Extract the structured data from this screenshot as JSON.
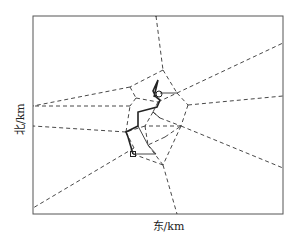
{
  "figure": {
    "xlabel": "东/km",
    "ylabel": "北/km",
    "frame": {
      "x": 33,
      "y": 16,
      "w": 250,
      "h": 198
    },
    "colors": {
      "line": "#333333",
      "frame": "#555555",
      "path": "#222222"
    },
    "dashed_edges": [
      [
        [
          156,
          16
        ],
        [
          163,
          70
        ]
      ],
      [
        [
          163,
          70
        ],
        [
          177,
          93
        ]
      ],
      [
        [
          163,
          70
        ],
        [
          130,
          87
        ]
      ],
      [
        [
          130,
          87
        ],
        [
          33,
          106
        ]
      ],
      [
        [
          130,
          87
        ],
        [
          136,
          98
        ]
      ],
      [
        [
          136,
          98
        ],
        [
          130,
          106
        ]
      ],
      [
        [
          130,
          106
        ],
        [
          33,
          106
        ]
      ],
      [
        [
          177,
          93
        ],
        [
          283,
          43
        ]
      ],
      [
        [
          177,
          93
        ],
        [
          188,
          105
        ]
      ],
      [
        [
          188,
          105
        ],
        [
          283,
          96
        ]
      ],
      [
        [
          188,
          105
        ],
        [
          181,
          126
        ]
      ],
      [
        [
          181,
          126
        ],
        [
          283,
          168
        ]
      ],
      [
        [
          181,
          126
        ],
        [
          163,
          165
        ]
      ],
      [
        [
          163,
          165
        ],
        [
          177,
          214
        ]
      ],
      [
        [
          163,
          165
        ],
        [
          133,
          154
        ]
      ],
      [
        [
          126,
          132
        ],
        [
          33,
          126
        ]
      ],
      [
        [
          126,
          132
        ],
        [
          130,
          106
        ]
      ],
      [
        [
          126,
          132
        ],
        [
          134,
          148
        ]
      ],
      [
        [
          134,
          148
        ],
        [
          33,
          208
        ]
      ],
      [
        [
          181,
          126
        ],
        [
          145,
          126
        ]
      ],
      [
        [
          145,
          126
        ],
        [
          126,
          132
        ]
      ],
      [
        [
          145,
          126
        ],
        [
          148,
          145
        ]
      ],
      [
        [
          148,
          145
        ],
        [
          163,
          165
        ]
      ],
      [
        [
          153,
          112
        ],
        [
          145,
          126
        ]
      ],
      [
        [
          153,
          112
        ],
        [
          160,
          118
        ]
      ],
      [
        [
          160,
          118
        ],
        [
          181,
          126
        ]
      ],
      [
        [
          165,
          137
        ],
        [
          181,
          126
        ]
      ],
      [
        [
          165,
          137
        ],
        [
          148,
          145
        ]
      ],
      [
        [
          136,
          98
        ],
        [
          158,
          102
        ]
      ],
      [
        [
          158,
          102
        ],
        [
          177,
          93
        ]
      ],
      [
        [
          158,
          102
        ],
        [
          153,
          112
        ]
      ],
      [
        [
          155,
          16
        ],
        [
          157,
          16
        ]
      ]
    ],
    "path": [
      [
        133,
        154
      ],
      [
        128,
        137
      ],
      [
        126,
        132
      ],
      [
        138,
        126
      ],
      [
        138,
        112
      ],
      [
        157,
        107
      ],
      [
        160,
        100
      ],
      [
        156,
        97
      ],
      [
        153,
        91
      ],
      [
        158,
        80
      ],
      [
        154,
        97
      ]
    ],
    "solid_edges": [
      [
        [
          160,
          93
        ],
        [
          177,
          93
        ]
      ],
      [
        [
          133,
          154
        ],
        [
          156,
          154
        ]
      ],
      [
        [
          156,
          154
        ],
        [
          148,
          145
        ]
      ],
      [
        [
          138,
          126
        ],
        [
          148,
          145
        ]
      ],
      [
        [
          153,
          112
        ],
        [
          160,
          118
        ]
      ]
    ],
    "start_marker": {
      "type": "circle",
      "x": 159,
      "y": 94,
      "r": 3
    },
    "end_marker": {
      "type": "square",
      "x": 133,
      "y": 154,
      "size": 5
    }
  }
}
